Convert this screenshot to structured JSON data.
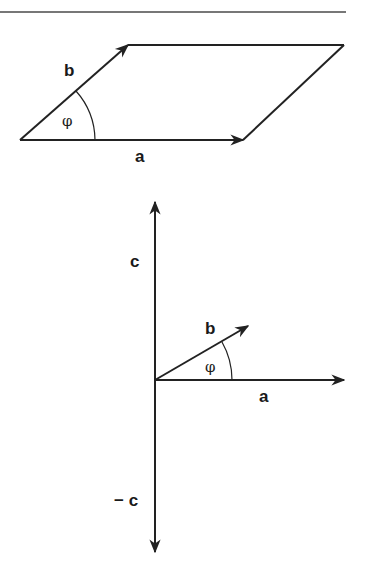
{
  "figure_top": {
    "description": "Parallelogram spanned by vectors a and b with angle phi",
    "labels": {
      "vector_a": "a",
      "vector_b": "b",
      "angle": "φ"
    }
  },
  "figure_bottom": {
    "description": "Cross product c perpendicular to a and b, with opposite vector -c",
    "labels": {
      "vector_a": "a",
      "vector_b": "b",
      "angle": "φ",
      "vector_c": "c",
      "vector_neg_c": "− c"
    }
  },
  "colors": {
    "ink": "#222222",
    "rule": "#777777",
    "background": "#ffffff"
  }
}
